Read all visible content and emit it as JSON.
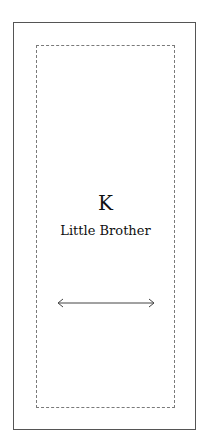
{
  "diagram": {
    "letter": "K",
    "title": "Little Brother",
    "arrow": "double-headed-horizontal",
    "colors": {
      "outer_border": "#555555",
      "dashed_border": "#7a7a7a",
      "text": "#111111",
      "arrow": "#444444"
    }
  }
}
